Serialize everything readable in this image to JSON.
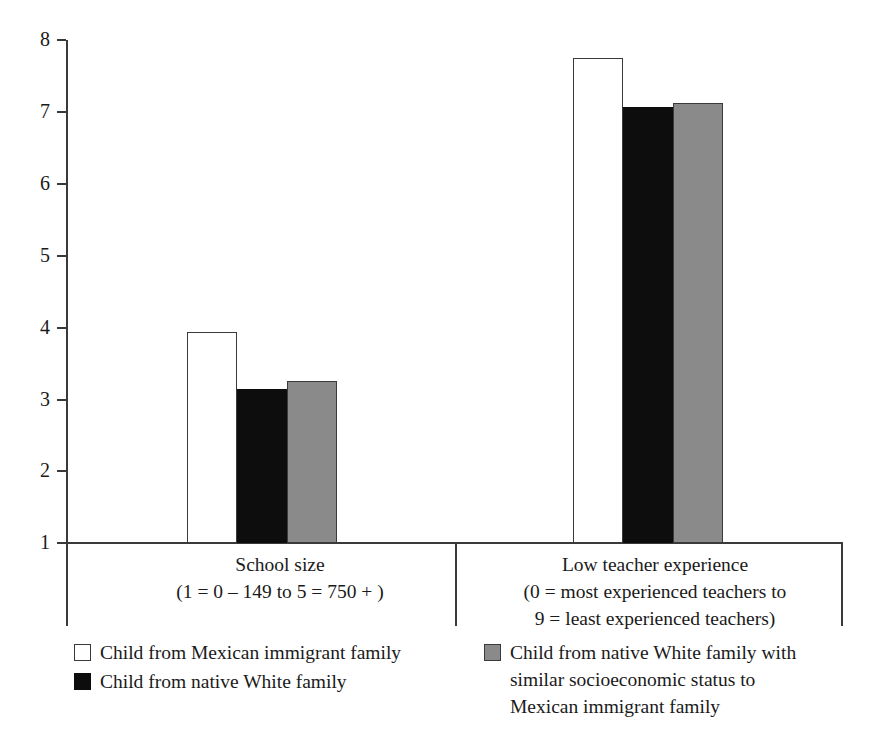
{
  "chart_data": {
    "type": "bar",
    "title": "",
    "subtitle": "",
    "xlabel": "",
    "ylabel": "",
    "ylim": [
      1,
      8
    ],
    "yticks": [
      1,
      2,
      3,
      4,
      5,
      6,
      7,
      8
    ],
    "ytick_labels": [
      "1",
      "2",
      "3",
      "4",
      "5",
      "6",
      "7",
      "8"
    ],
    "grid": false,
    "legend_position": "bottom",
    "categories": [
      "School size",
      "Low teacher experience"
    ],
    "category_sublabels": [
      [
        "(1 = 0 – 149 to 5 = 750 + )"
      ],
      [
        "(0 = most experienced teachers to",
        "9 = least experienced teachers)"
      ]
    ],
    "series": [
      {
        "name": "Child from Mexican immigrant family",
        "color": "#ffffff",
        "edge_color": "#3a3a3a",
        "values": [
          3.94,
          7.75
        ]
      },
      {
        "name": "Child from native White family",
        "color": "#0d0d0d",
        "edge_color": "#0d0d0d",
        "values": [
          3.14,
          7.07
        ]
      },
      {
        "name": "Child from native White family with similar socioeconomic status to Mexican immigrant family",
        "color": "#8a8a8a",
        "edge_color": "#3a3a3a",
        "values": [
          3.25,
          7.12
        ]
      }
    ]
  },
  "axis": {
    "ticks": [
      {
        "label": "8",
        "value": 8
      },
      {
        "label": "7",
        "value": 7
      },
      {
        "label": "6",
        "value": 6
      },
      {
        "label": "5",
        "value": 5
      },
      {
        "label": "4",
        "value": 4
      },
      {
        "label": "3",
        "value": 3
      },
      {
        "label": "2",
        "value": 2
      },
      {
        "label": "1",
        "value": 1
      }
    ]
  },
  "groups": [
    {
      "id": "school-size",
      "line1": "School size",
      "line2": "(1 = 0 – 149 to 5 = 750 + )",
      "line3": ""
    },
    {
      "id": "low-teacher-experience",
      "line1": "Low teacher experience",
      "line2": "(0 = most experienced teachers to",
      "line3": "9 = least experienced teachers)"
    }
  ],
  "legend": {
    "left": [
      {
        "swatch": "white-square-icon",
        "line1": "Child from Mexican immigrant family",
        "line2": "",
        "line3": ""
      },
      {
        "swatch": "black-square-icon",
        "line1": "Child from native White family",
        "line2": "",
        "line3": ""
      }
    ],
    "right": [
      {
        "swatch": "gray-square-icon",
        "line1": "Child from native White family with",
        "line2": "similar socioeconomic status to",
        "line3": "Mexican immigrant family"
      }
    ]
  },
  "colors": {
    "series_white": "#ffffff",
    "series_black": "#0d0d0d",
    "series_gray": "#8a8a8a",
    "axis": "#3a3a3a",
    "text": "#1a1a1a",
    "background": "#ffffff"
  }
}
